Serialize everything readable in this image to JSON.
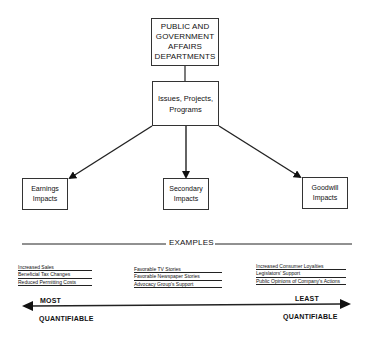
{
  "diagram": {
    "root": {
      "lines": [
        "PUBLIC AND",
        "GOVERNMENT",
        "AFFAIRS",
        "DEPARTMENTS"
      ]
    },
    "middle": {
      "lines": [
        "Issues, Projects,",
        "Programs"
      ]
    },
    "impacts": [
      {
        "lines": [
          "Earnings",
          "Impacts"
        ]
      },
      {
        "lines": [
          "Secondary",
          "Impacts"
        ]
      },
      {
        "lines": [
          "Goodwill",
          "Impacts"
        ]
      }
    ],
    "examples_label": "EXAMPLES",
    "examples": [
      [
        "Increased Sales",
        "Beneficial Tax Changes",
        "Reduced Permitting Costs"
      ],
      [
        "Favorable TV Stories",
        "Favorable Newspaper Stories",
        "Advocacy Group's Support"
      ],
      [
        "Increased Consumer Loyalties",
        "Legislators' Support",
        "Public Opinions of Company's Actions"
      ]
    ],
    "scale": {
      "left_top": "MOST",
      "left_bottom": "QUANTIFIABLE",
      "right_top": "LEAST",
      "right_bottom": "QUANTIFIABLE"
    }
  }
}
